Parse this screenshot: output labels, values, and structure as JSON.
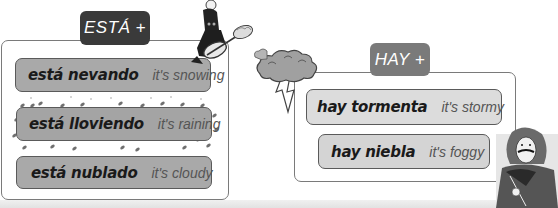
{
  "esta_panel": {
    "tag_label": "ESTÁ +",
    "phrases": [
      {
        "spanish": "está nevando",
        "english": "it's snowing"
      },
      {
        "spanish": "está lloviendo",
        "english": "it's raining"
      },
      {
        "spanish": "está nublado",
        "english": "it's cloudy"
      }
    ]
  },
  "hay_panel": {
    "tag_label": "HAY +",
    "phrases": [
      {
        "spanish": "hay tormenta",
        "english": "it's stormy"
      },
      {
        "spanish": "hay niebla",
        "english": "it's foggy"
      }
    ]
  },
  "illustrations": {
    "snowman_character": "character-with-shovel-icon",
    "storm_cloud": "storm-cloud-lightning-icon",
    "portrait_character": "musketeer-portrait-icon"
  }
}
